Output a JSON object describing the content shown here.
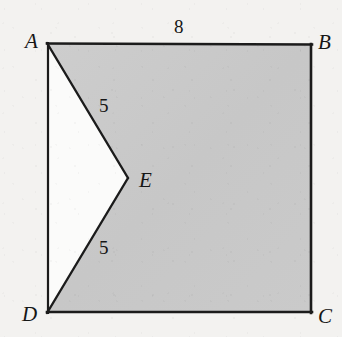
{
  "figure": {
    "kind": "geometry-diagram",
    "colors": {
      "paper": "#f3f2f0",
      "shaded_fill": "#c9c9c9",
      "notch_fill": "#fbfbfa",
      "stroke": "#1b1b1b"
    },
    "vertices": {
      "A": {
        "label": "A",
        "x": 47,
        "y": 43
      },
      "B": {
        "label": "B",
        "x": 312,
        "y": 44
      },
      "C": {
        "label": "C",
        "x": 312,
        "y": 313
      },
      "D": {
        "label": "D",
        "x": 47,
        "y": 313
      },
      "E": {
        "label": "E",
        "x": 128,
        "y": 178
      }
    },
    "measurements": {
      "top_edge": "8",
      "upper_side": "5",
      "lower_side": "5"
    },
    "shaded_polygon": "47,43 312,44 312,313 47,313 128,178",
    "notch_polygon": "47,43 128,178 47,313",
    "square_outline": "47,43 312,44 312,313 47,313"
  }
}
